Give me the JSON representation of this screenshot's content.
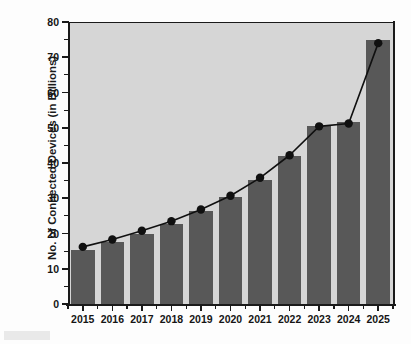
{
  "chart_data": {
    "type": "bar",
    "title": "",
    "subtitle": "",
    "xlabel": "",
    "ylabel": "No. of Connected Devices (in Billions)",
    "categories": [
      "2015",
      "2016",
      "2017",
      "2018",
      "2019",
      "2020",
      "2021",
      "2022",
      "2023",
      "2024",
      "2025"
    ],
    "values": [
      15.4,
      17.5,
      20.0,
      22.8,
      26.3,
      30.4,
      35.3,
      42.1,
      50.5,
      51.5,
      75.0
    ],
    "series": [
      {
        "name": "Connected devices (bars)",
        "type": "bar",
        "values": [
          15.4,
          17.5,
          20.0,
          22.8,
          26.3,
          30.4,
          35.3,
          42.1,
          50.5,
          51.5,
          75.0
        ]
      },
      {
        "name": "Connected devices (trend line)",
        "type": "line",
        "values": [
          16.2,
          18.3,
          20.8,
          23.5,
          26.8,
          30.7,
          35.8,
          42.2,
          50.4,
          51.2,
          74.0
        ]
      }
    ],
    "ylim": [
      0,
      80
    ],
    "ytick_values": [
      0,
      10,
      20,
      30,
      40,
      50,
      60,
      70,
      80
    ],
    "ytick_labels": [
      "0",
      "10",
      "20",
      "30",
      "40",
      "50",
      "60",
      "70",
      "80"
    ],
    "yminor_tick_values": [
      5,
      15,
      25,
      35,
      45,
      55,
      65,
      75
    ],
    "grid": false,
    "legend": false,
    "legend_position": "none",
    "colors": {
      "bar_fill": "#585858",
      "line": "#101010",
      "marker": "#101010",
      "plot_background": "#d6d6d6",
      "figure_background": "#fdfdfd",
      "axis": "#1a1a1a",
      "text": "#151515"
    }
  }
}
